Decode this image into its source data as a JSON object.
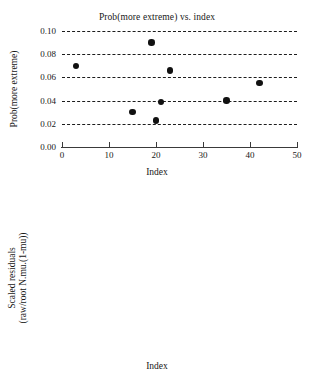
{
  "figure": {
    "width": 314,
    "height": 382,
    "background": "#ffffff",
    "marker_color": "#111111",
    "gridline_color": "#1c1c1c",
    "axis_color": "#3a3a3a"
  },
  "chart_data": [
    {
      "type": "scatter",
      "id": "prob-more-extreme",
      "title": "Prob(more extreme) vs. index",
      "xlabel": "Index",
      "ylabel": "Prob(more extreme)",
      "xlim": [
        0,
        50
      ],
      "ylim": [
        0.0,
        0.1
      ],
      "xticks": [
        0,
        10,
        20,
        30,
        40,
        50
      ],
      "xtick_labels": [
        "0",
        "10",
        "20",
        "30",
        "40",
        "50"
      ],
      "yticks": [
        0.0,
        0.02,
        0.04,
        0.06,
        0.08,
        0.1
      ],
      "ytick_labels": [
        "0.00",
        "0.02",
        "0.04",
        "0.06",
        "0.08",
        "0.10"
      ],
      "grid": true,
      "grid_style": "dashed",
      "grid_on_yticks_above_zero": true,
      "legend": "none",
      "points": [
        {
          "x": 3,
          "y": 0.07
        },
        {
          "x": 15,
          "y": 0.03
        },
        {
          "x": 19,
          "y": 0.09
        },
        {
          "x": 20,
          "y": 0.023
        },
        {
          "x": 21,
          "y": 0.039
        },
        {
          "x": 23,
          "y": 0.066
        },
        {
          "x": 35,
          "y": 0.04
        },
        {
          "x": 42,
          "y": 0.055
        }
      ]
    },
    {
      "type": "scatter",
      "id": "scaled-residuals",
      "title": "Scaled residuals vs. index",
      "xlabel": "Index",
      "ylabel": "Scaled residuals",
      "ylabel_line2": "(raw/root N.mu.(1-mu))",
      "xlim": [
        0,
        50
      ],
      "ylim": [
        -3,
        3
      ],
      "xticks": [
        0,
        10,
        20,
        30,
        40,
        50
      ],
      "xtick_labels": [
        "0",
        "10",
        "20",
        "30",
        "40",
        "50"
      ],
      "yticks": [
        -3,
        -2,
        -1,
        0,
        1,
        2,
        3
      ],
      "ytick_labels": [
        "−3",
        "−2",
        "−1",
        "0",
        "1",
        "2",
        "3"
      ],
      "grid": true,
      "grid_style": "dashed",
      "zero_line": true,
      "legend": "none",
      "points": [
        {
          "x": 1,
          "y": -0.8
        },
        {
          "x": 2,
          "y": 0.75
        },
        {
          "x": 3,
          "y": -1.85
        },
        {
          "x": 4,
          "y": 1.6
        },
        {
          "x": 5,
          "y": 0.55
        },
        {
          "x": 6,
          "y": -0.3
        },
        {
          "x": 7,
          "y": -1.55
        },
        {
          "x": 8,
          "y": 1.35
        },
        {
          "x": 9,
          "y": -0.75
        },
        {
          "x": 10,
          "y": -0.8
        },
        {
          "x": 11,
          "y": 0.65
        },
        {
          "x": 12,
          "y": -1.15
        },
        {
          "x": 13,
          "y": 1.02
        },
        {
          "x": 14,
          "y": -0.45
        },
        {
          "x": 15,
          "y": -2.05
        },
        {
          "x": 16,
          "y": 0.48
        },
        {
          "x": 17,
          "y": 1.25
        },
        {
          "x": 18,
          "y": -1.15
        },
        {
          "x": 19,
          "y": 1.1
        },
        {
          "x": 20,
          "y": -1.85
        },
        {
          "x": 21,
          "y": 2.38
        },
        {
          "x": 22,
          "y": 2.45
        },
        {
          "x": 23,
          "y": -1.5
        },
        {
          "x": 24,
          "y": 2.12
        },
        {
          "x": 25,
          "y": -1.45
        },
        {
          "x": 26,
          "y": 1.7
        },
        {
          "x": 27,
          "y": -1.02
        },
        {
          "x": 28,
          "y": 1.0
        },
        {
          "x": 29,
          "y": -0.55
        },
        {
          "x": 30,
          "y": 1.0
        },
        {
          "x": 31,
          "y": -0.95
        },
        {
          "x": 32,
          "y": 0.65
        },
        {
          "x": 33,
          "y": -0.35
        },
        {
          "x": 34,
          "y": -0.1
        },
        {
          "x": 34.5,
          "y": 0.35
        },
        {
          "x": 35,
          "y": 2.5
        },
        {
          "x": 36,
          "y": -1.5
        },
        {
          "x": 37,
          "y": -1.05
        },
        {
          "x": 38,
          "y": 1.02
        },
        {
          "x": 39,
          "y": -1.02
        },
        {
          "x": 40,
          "y": 0.9
        },
        {
          "x": 41,
          "y": -1.3
        },
        {
          "x": 42,
          "y": 2.0
        },
        {
          "x": 43,
          "y": 0.68
        },
        {
          "x": 44,
          "y": -0.05
        }
      ]
    }
  ]
}
